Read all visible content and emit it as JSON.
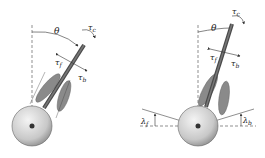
{
  "figures": [
    {
      "name": "flat-ground",
      "labels": {
        "theta": "θ",
        "tau_c": "τ",
        "tau_c_sub": "c",
        "tau_f": "τ",
        "tau_f_sub": "f",
        "tau_b": "τ",
        "tau_b_sub": "b"
      }
    },
    {
      "name": "inclined-ground",
      "labels": {
        "theta": "θ",
        "tau_c": "τ",
        "tau_c_sub": "c",
        "tau_f": "τ",
        "tau_f_sub": "f",
        "tau_b": "τ",
        "tau_b_sub": "b",
        "lambda_f": "λ",
        "lambda_f_sub": "f",
        "lambda_b": "λ",
        "lambda_b_sub": "b"
      }
    }
  ],
  "colors": {
    "wheel_light": "#eeeeee",
    "wheel_dark": "#9a9a9a",
    "rod": "#555555",
    "leg": "#8a8a8a",
    "line": "#333333"
  }
}
